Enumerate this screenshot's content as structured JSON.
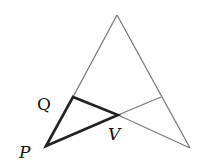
{
  "diagram": {
    "labels": {
      "Q": "Q",
      "P": "P",
      "V": "V"
    },
    "colors": {
      "thin_line": "#777777",
      "thick_line": "#222222",
      "text": "#111111"
    },
    "points": {
      "apex": [
        117,
        15
      ],
      "bottom_right": [
        190,
        148
      ],
      "P": [
        46,
        146
      ],
      "Q": [
        73,
        97
      ],
      "V": [
        118,
        115
      ],
      "R": [
        161,
        97
      ]
    }
  }
}
